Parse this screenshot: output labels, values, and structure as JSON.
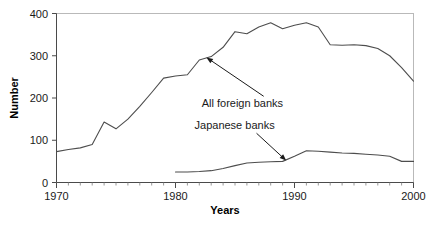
{
  "chart_data": {
    "type": "line",
    "title": "",
    "xlabel": "Years",
    "ylabel": "Number",
    "xlim": [
      1970,
      2000
    ],
    "ylim": [
      0,
      400
    ],
    "grid": false,
    "legend_position": "inline-annotations",
    "x_ticks": [
      1970,
      1980,
      1990,
      2000
    ],
    "x_tick_labels": [
      "1970",
      "1980",
      "1990",
      "2000"
    ],
    "x_minor_tick_step": 1,
    "y_ticks": [
      0,
      100,
      200,
      300,
      400
    ],
    "y_tick_labels": [
      "0",
      "100",
      "200",
      "300",
      "400"
    ],
    "series": [
      {
        "name": "All foreign banks",
        "x": [
          1970,
          1971,
          1972,
          1973,
          1974,
          1975,
          1976,
          1977,
          1978,
          1979,
          1980,
          1981,
          1982,
          1983,
          1984,
          1985,
          1986,
          1987,
          1988,
          1989,
          1990,
          1991,
          1992,
          1993,
          1994,
          1995,
          1996,
          1997,
          1998,
          1999,
          2000
        ],
        "values": [
          73,
          78,
          82,
          90,
          143,
          127,
          150,
          180,
          213,
          247,
          252,
          255,
          290,
          298,
          320,
          357,
          352,
          368,
          378,
          364,
          372,
          378,
          368,
          326,
          325,
          326,
          324,
          317,
          300,
          272,
          240
        ]
      },
      {
        "name": "Japanese banks",
        "x": [
          1980,
          1981,
          1982,
          1983,
          1984,
          1985,
          1986,
          1987,
          1988,
          1989,
          1990,
          1991,
          1992,
          1993,
          1994,
          1995,
          1996,
          1997,
          1998,
          1999,
          2000
        ],
        "values": [
          25,
          25,
          26,
          28,
          33,
          40,
          46,
          48,
          49,
          50,
          62,
          75,
          74,
          72,
          70,
          69,
          67,
          65,
          62,
          50,
          50
        ]
      }
    ],
    "annotations": [
      {
        "text": "All foreign banks",
        "label_x": 1982.2,
        "label_y": 178,
        "target_x": 1982.6,
        "target_y": 296
      },
      {
        "text": "Japanese banks",
        "label_x": 1981.6,
        "label_y": 126,
        "target_x": 1989.3,
        "target_y": 52
      }
    ]
  }
}
